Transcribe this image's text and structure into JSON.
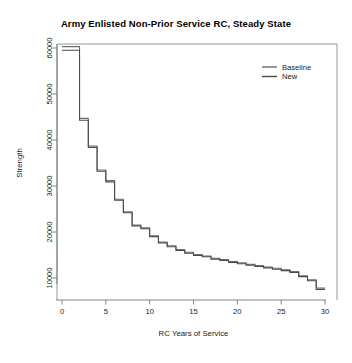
{
  "chart_data": {
    "type": "line",
    "subtype": "step",
    "title": "Army Enlisted Non-Prior Service RC, Steady State",
    "xlabel": "RC Years of Service",
    "ylabel": "Strength",
    "xlim": [
      0,
      30
    ],
    "ylim": [
      6000,
      62000
    ],
    "xticks": [
      0,
      5,
      10,
      15,
      20,
      25,
      30
    ],
    "xticklabels": [
      "0",
      "5",
      "10",
      "15",
      "20",
      "25",
      "30"
    ],
    "yticks": [
      10000,
      20000,
      30000,
      40000,
      50000,
      60000
    ],
    "yticklabels": [
      "10000",
      "20000",
      "30000",
      "40000",
      "50000",
      "60000"
    ],
    "grid": false,
    "legend_position": "top-right",
    "x": [
      0,
      1,
      2,
      3,
      4,
      5,
      6,
      7,
      8,
      9,
      10,
      11,
      12,
      13,
      14,
      15,
      16,
      17,
      18,
      19,
      20,
      21,
      22,
      23,
      24,
      25,
      26,
      27,
      28,
      29,
      30
    ],
    "series": [
      {
        "name": "Baseline",
        "color": "#6e6e6e",
        "values": [
          60300,
          60300,
          44700,
          38700,
          33500,
          31200,
          27100,
          24400,
          21500,
          20900,
          19200,
          17800,
          17000,
          16200,
          15600,
          15100,
          14800,
          14300,
          14000,
          13600,
          13300,
          13000,
          12700,
          12400,
          12100,
          11800,
          11400,
          10500,
          9600,
          7800,
          7800
        ]
      },
      {
        "name": "New",
        "color": "#4a4a4a",
        "values": [
          59500,
          59500,
          44300,
          38400,
          33200,
          30900,
          26900,
          24200,
          21300,
          20700,
          19000,
          17600,
          16800,
          16000,
          15400,
          14900,
          14600,
          14100,
          13800,
          13400,
          13100,
          12800,
          12500,
          12200,
          11900,
          11600,
          11200,
          10300,
          9400,
          7500,
          7500
        ]
      }
    ]
  },
  "legend": {
    "entries": [
      {
        "label": "Baseline"
      },
      {
        "label": "New"
      }
    ]
  }
}
